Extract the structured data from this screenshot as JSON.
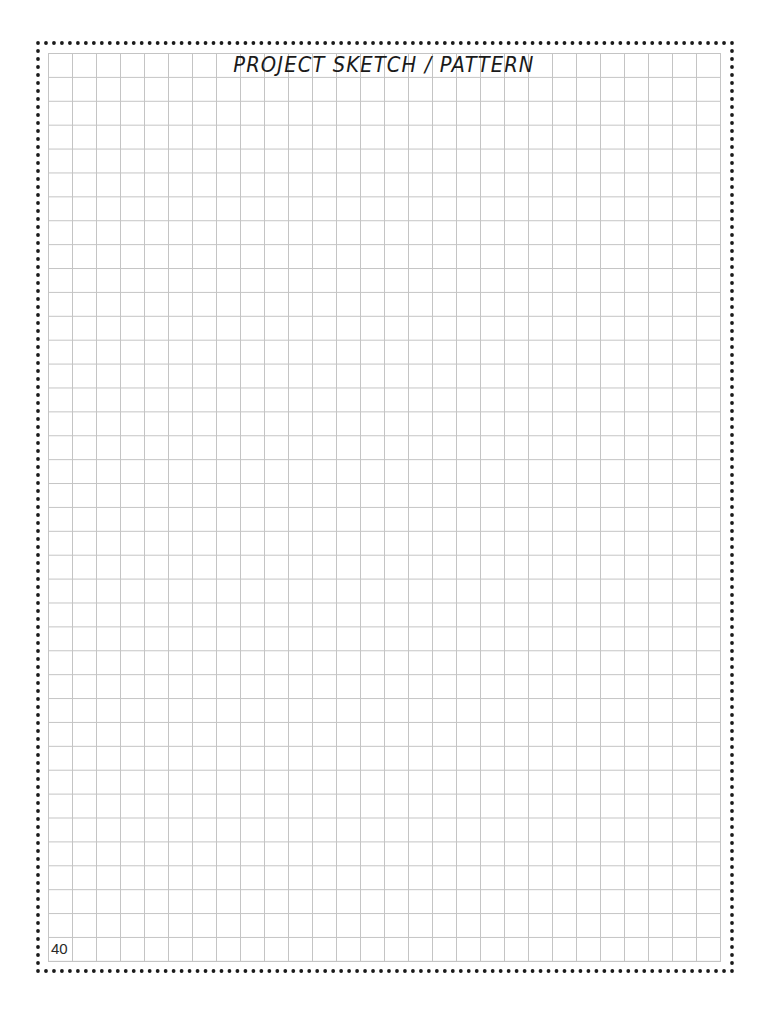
{
  "page": {
    "title": "PROJECT SKETCH / PATTERN",
    "page_number": "40",
    "grid": {
      "columns": 28,
      "rows": 38,
      "line_color": "#c4c4c4"
    },
    "frame": {
      "style": "dotted",
      "dot_color": "#1a1a1a"
    }
  }
}
